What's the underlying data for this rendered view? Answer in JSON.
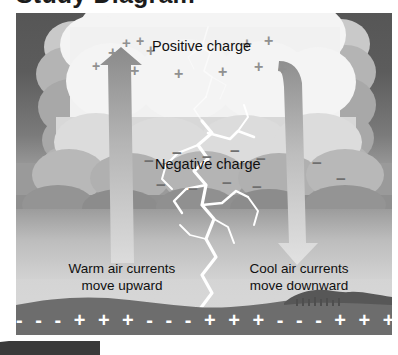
{
  "page": {
    "title_cut_off": "Study Diagram",
    "background": "#ffffff"
  },
  "figure": {
    "name": "thunderstorm-charge-diagram",
    "labels": {
      "positive_charge": "Positive charge",
      "negative_charge": "Negative charge",
      "warm_line1": "Warm air currents",
      "warm_line2": "move upward",
      "cool_line1": "Cool air currents",
      "cool_line2": "move downward"
    },
    "ground_charge_sequence": "- - - + + + - - - + + + - - - + + + - - - + + +",
    "colors": {
      "sky_top": "#565656",
      "sky_bottom": "#d4d4d4",
      "cloud_light": "#ececec",
      "cloud_shadow": "#a8a8a8",
      "ground": "#6d6d6d",
      "arrow_dark": "#8c8c8c",
      "arrow_light": "#d8d8d8",
      "lightning": "#ffffff",
      "text": "#101010",
      "ground_symbol": "#ffffff"
    },
    "symbols": {
      "plus": "+",
      "minus": "−"
    },
    "positive_symbols_count": 12,
    "negative_symbols_count": 11,
    "arrows": [
      {
        "name": "warm-air-updraft-arrow",
        "direction": "up"
      },
      {
        "name": "cool-air-downdraft-arrow",
        "direction": "down"
      }
    ],
    "lightning_bolt": "branching cloud-to-ground lightning"
  }
}
